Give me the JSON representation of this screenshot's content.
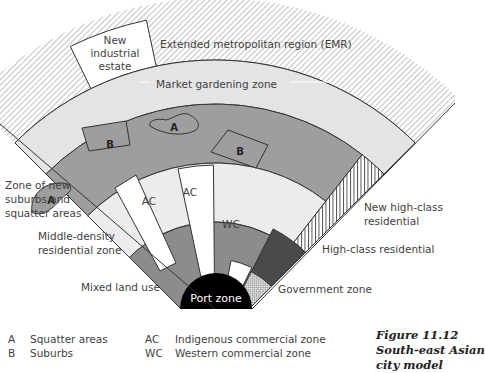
{
  "diagram": {
    "type": "urban-land-use-model",
    "zones": {
      "emr": "Extended metropolitan region (EMR)",
      "new_industrial": "New industrial estate",
      "market_gardening": "Market gardening zone",
      "new_suburbs": "Zone of new suburbs and squatter areas",
      "middle_density": "Middle-density residential zone",
      "mixed_land_use": "Mixed land use",
      "port": "Port zone",
      "government": "Government zone",
      "high_class": "High-class residential",
      "new_high_class": "New high-class residential"
    },
    "labels": {
      "new_industrial_lines": [
        "New",
        "industrial",
        "estate"
      ],
      "new_suburbs_lines": [
        "Zone of new",
        "suburbs and",
        "squatter areas"
      ],
      "middle_density_lines": [
        "Middle-density",
        "residential zone"
      ],
      "new_high_class_lines": [
        "New high-class",
        "residential"
      ],
      "patch_a": "A",
      "patch_b": "B",
      "ac": "AC",
      "wc": "WC"
    },
    "colors": {
      "emr_hatch": "#9a9a9a",
      "market": "#e4e4e4",
      "squatter_ring": "#9e9e9e",
      "middle": "#ececec",
      "mixed": "#8c8c8c",
      "commercial": "#ffffff",
      "port": "#000000",
      "high_class": "#4a4a4a",
      "outline": "#333333"
    }
  },
  "legend": [
    {
      "key": "A",
      "text": "Squatter areas"
    },
    {
      "key": "B",
      "text": "Suburbs"
    },
    {
      "key": "AC",
      "text": "Indigenous commercial zone"
    },
    {
      "key": "WC",
      "text": "Western commercial zone"
    }
  ],
  "caption": {
    "number": "Figure 11.12",
    "title_lines": [
      "South-east Asian",
      "city model"
    ]
  }
}
